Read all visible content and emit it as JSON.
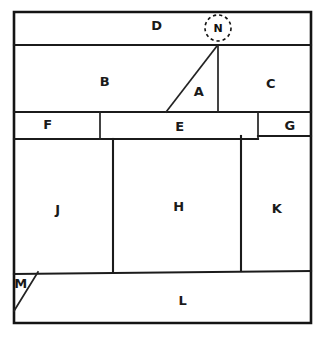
{
  "diagram": {
    "kind": "floor-plan",
    "stroke_color": "#1b1b1b",
    "background_color": "#ffffff",
    "rooms": [
      {
        "id": "D",
        "label": "D",
        "label_x": 157,
        "label_y": 26
      },
      {
        "id": "B",
        "label": "B",
        "label_x": 105,
        "label_y": 82
      },
      {
        "id": "A",
        "label": "A",
        "label_x": 199,
        "label_y": 92
      },
      {
        "id": "C",
        "label": "C",
        "label_x": 271,
        "label_y": 84
      },
      {
        "id": "F",
        "label": "F",
        "label_x": 48,
        "label_y": 125
      },
      {
        "id": "E",
        "label": "E",
        "label_x": 180,
        "label_y": 127
      },
      {
        "id": "G",
        "label": "G",
        "label_x": 290,
        "label_y": 126
      },
      {
        "id": "J",
        "label": "J",
        "label_x": 58,
        "label_y": 210
      },
      {
        "id": "H",
        "label": "H",
        "label_x": 179,
        "label_y": 207
      },
      {
        "id": "K",
        "label": "K",
        "label_x": 277,
        "label_y": 209
      },
      {
        "id": "M",
        "label": "M",
        "label_x": 21,
        "label_y": 284
      },
      {
        "id": "L",
        "label": "L",
        "label_x": 183,
        "label_y": 301
      }
    ],
    "nodes": [
      {
        "id": "N",
        "label": "N",
        "cx": 218,
        "cy": 28,
        "radius": 13,
        "marker": "dashed-circle",
        "highlighted": true
      }
    ],
    "geometry": {
      "outline": "M14,12 L311,12 L311,323 L14,323 Z",
      "walls": [
        {
          "name": "d-row-bottom",
          "d": "M14,45 L311,45"
        },
        {
          "name": "band-top",
          "d": "M14,112 L311,112"
        },
        {
          "name": "band-bottom-left",
          "d": "M14,139 L258,139"
        },
        {
          "name": "band-bottom-right",
          "d": "M258,136 L311,136"
        },
        {
          "name": "f-e-divider",
          "d": "M100,112 L100,139"
        },
        {
          "name": "e-g-divider",
          "d": "M258,112 L258,139"
        },
        {
          "name": "a-c-divider",
          "d": "M218,46 L218,112"
        },
        {
          "name": "a-b-diagonal",
          "d": "M217,46 L166,112"
        },
        {
          "name": "j-h-divider",
          "d": "M113,139 L113,272"
        },
        {
          "name": "h-k-divider",
          "d": "M241,136 L241,271"
        },
        {
          "name": "l-row-top",
          "d": "M14,274 L311,271"
        },
        {
          "name": "m-diagonal",
          "d": "M14,311 L38,272"
        }
      ]
    }
  }
}
